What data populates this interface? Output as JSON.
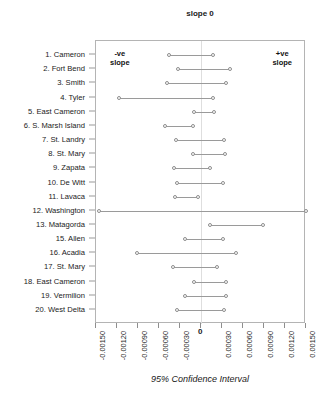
{
  "chart_data": {
    "type": "dot",
    "title": "",
    "top_annotation": {
      "line1": "slope",
      "line2": "0"
    },
    "left_annotation": {
      "line1": "-ve",
      "line2": "slope"
    },
    "right_annotation": {
      "line1": "+ve",
      "line2": "slope"
    },
    "xlabel": "95% Confidence Interval",
    "ylabel": "",
    "xlim": [
      -0.0015,
      0.0015
    ],
    "xticks": [
      -0.0015,
      -0.0012,
      -0.0009,
      -0.0006,
      -0.0003,
      0,
      0.0003,
      0.0006,
      0.0009,
      0.0012,
      0.0015
    ],
    "xticklabels": [
      "-0.00150",
      "-0.00120",
      "-0.00090",
      "-0.00060",
      "-0.00030",
      "0",
      "0.00030",
      "0.00060",
      "0.00090",
      "0.00120",
      "0.00150"
    ],
    "grid": false,
    "legend": false,
    "zero_reference_line": 0,
    "categories": [
      "1. Cameron",
      "2. Fort Bend",
      "3. Smith",
      "4. Tyler",
      "5. East Cameron",
      "6. S. Marsh Island",
      "7. St. Landry",
      "8. St. Mary",
      "9. Zapata",
      "10. De Witt",
      "11. Lavaca",
      "12. Washington",
      "13. Matagorda",
      "15. Allen",
      "16. Acadia",
      "17. St. Mary",
      "18. East Cameron",
      "19. Vermilion",
      "20. West Delta"
    ],
    "series": [
      {
        "name": "lower",
        "values": [
          -0.00046,
          -0.00033,
          -0.00049,
          -0.00117,
          -0.0001,
          -0.00052,
          -0.00036,
          -0.00012,
          -0.00039,
          -0.00035,
          -0.00037,
          -0.00146,
          0.00013,
          -0.00023,
          -0.00092,
          -0.0004,
          -0.0001,
          -0.00023,
          -0.00035
        ]
      },
      {
        "name": "upper",
        "values": [
          0.00017,
          0.00041,
          0.00036,
          0.00017,
          0.00019,
          -0.00012,
          0.00033,
          0.00034,
          0.00013,
          0.00032,
          -5e-05,
          0.0015,
          0.00088,
          0.00031,
          0.0005,
          0.00023,
          0.00035,
          0.00036,
          0.00033
        ]
      }
    ],
    "colors": {
      "line": "#9a9a9a",
      "marker_edge": "#8e8e8e",
      "marker_fill": "#ffffff",
      "frame": "#b4b4b4",
      "zero_line": "#dedede",
      "text": "#1a1a1a"
    }
  }
}
